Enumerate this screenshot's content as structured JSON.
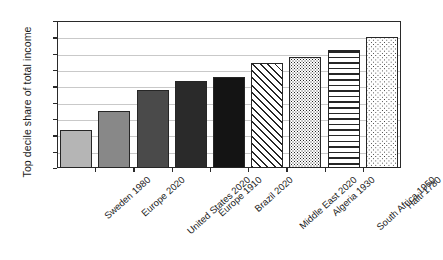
{
  "chart_data": {
    "type": "bar",
    "title": "",
    "subtitle": "",
    "xlabel": "",
    "ylabel": "Top decile share of total income",
    "ylim": [
      0,
      90
    ],
    "ytick_labels": [
      "90%",
      "80%",
      "70%",
      "60%",
      "50%",
      "40%",
      "30%",
      "20%",
      "10%",
      "0%"
    ],
    "ytick_values": [
      90,
      80,
      70,
      60,
      50,
      40,
      30,
      20,
      10,
      0
    ],
    "grid": true,
    "legend": "none",
    "value_unit": "percent",
    "categories": [
      "Sweden 1980",
      "Europe 2020",
      "United States 2020",
      "Europe 1910",
      "Brazil 2020",
      "Middle East 2020",
      "Algeria 1930",
      "South Africa 1950",
      "Haiti 1780"
    ],
    "values": [
      23,
      35,
      48,
      53,
      56,
      64,
      68,
      72,
      80
    ],
    "bar_styles": [
      {
        "fill": "solid",
        "color": "#b5b5b5",
        "edge": "#262626"
      },
      {
        "fill": "solid",
        "color": "#888888",
        "edge": "#262626"
      },
      {
        "fill": "solid",
        "color": "#4a4a4a",
        "edge": "#262626"
      },
      {
        "fill": "solid",
        "color": "#2a2a2a",
        "edge": "#262626"
      },
      {
        "fill": "solid",
        "color": "#141414",
        "edge": "#262626"
      },
      {
        "fill": "diagonal-stripes",
        "color": "#ffffff",
        "edge": "#262626"
      },
      {
        "fill": "fine-dots",
        "color": "#ffffff",
        "edge": "#262626"
      },
      {
        "fill": "horizontal-lines",
        "color": "#ffffff",
        "edge": "#262626"
      },
      {
        "fill": "sparse-dots",
        "color": "#ffffff",
        "edge": "#262626"
      }
    ]
  },
  "colors": {
    "axis": "#2a2a2a",
    "gridline": "#c9c9c9",
    "background": "#ffffff",
    "text": "#1a1a1a"
  }
}
